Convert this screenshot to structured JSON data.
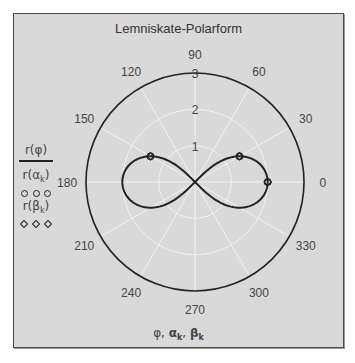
{
  "chart_data": {
    "type": "polar-line",
    "title": "Lemniskate-Polarform",
    "xlabel": "φ, αk, βk",
    "angular_ticks": [
      0,
      30,
      60,
      90,
      120,
      150,
      180,
      210,
      240,
      270,
      300,
      330
    ],
    "radial_ticks": [
      1,
      2,
      3
    ],
    "rlim": [
      0,
      3
    ],
    "grid": true,
    "legend_position": "left",
    "series": [
      {
        "name": "r(φ)",
        "style": "line",
        "formula": "r = 2·sqrt(cos(2φ))",
        "a": 2
      },
      {
        "name": "r(αk)",
        "style": "circle-markers",
        "points": [
          {
            "angle_deg": 0,
            "r": 2.0
          },
          {
            "angle_deg": 30,
            "r": 1.414
          },
          {
            "angle_deg": 150,
            "r": 1.414
          }
        ]
      },
      {
        "name": "r(βk)",
        "style": "diamond-markers",
        "points": [
          {
            "angle_deg": 0,
            "r": 2.0
          },
          {
            "angle_deg": 30,
            "r": 1.414
          },
          {
            "angle_deg": 150,
            "r": 1.414
          }
        ]
      }
    ]
  },
  "legend": {
    "line_label": "r(φ)",
    "alpha_label_main": "r(α",
    "alpha_label_sub": "k",
    "alpha_label_end": ")",
    "beta_label_main": "r(β",
    "beta_label_sub": "k",
    "beta_label_end": ")"
  },
  "axis_label": {
    "phi": "φ, ",
    "alpha": "α",
    "beta": "β",
    "sub": "k",
    "sep": ", "
  },
  "colors": {
    "background": "#d9d9d9",
    "curve": "#222222",
    "outer_circle": "#222222",
    "grid": "#f2f2f2",
    "text": "#444444"
  }
}
